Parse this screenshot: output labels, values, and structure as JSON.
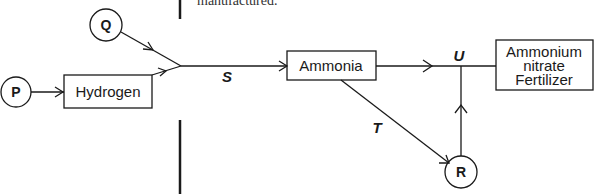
{
  "top_text": "manufactured.",
  "nodes": {
    "p": "P",
    "q": "Q",
    "r": "R",
    "hydrogen": "Hydrogen",
    "ammonia": "Ammonia",
    "fertilizer": [
      "Ammonium",
      "nitrate",
      "Fertilizer"
    ]
  },
  "edge_labels": {
    "s": "S",
    "t": "T",
    "u": "U"
  },
  "colors": {
    "stroke": "#1a1a1a",
    "background": "#ffffff"
  }
}
